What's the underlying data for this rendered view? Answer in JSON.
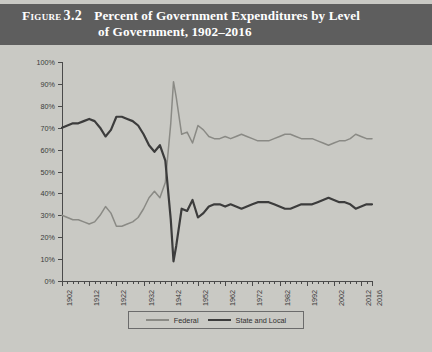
{
  "figure": {
    "label": "Figure",
    "number": "3.2",
    "title_line1": "Percent of Government Expenditures by Level",
    "title_line2": "of Government, 1902–2016",
    "banner_color": "#5e5e5e",
    "background_color": "#c9c9c4"
  },
  "legend": {
    "position": "bottom-center",
    "items": [
      {
        "label": "Federal",
        "color": "#8a8a85"
      },
      {
        "label": "State and Local",
        "color": "#3c3c3c"
      }
    ]
  },
  "chart_data": {
    "type": "line",
    "title": "Percent of Government Expenditures by Level of Government, 1902–2016",
    "xlabel": "",
    "ylabel": "",
    "ylim": [
      0,
      100
    ],
    "xlim": [
      1902,
      2016
    ],
    "grid": false,
    "y_tick_labels": [
      "0%",
      "10%",
      "20%",
      "30%",
      "40%",
      "50%",
      "60%",
      "70%",
      "80%",
      "90%",
      "100%"
    ],
    "y_ticks": [
      0,
      10,
      20,
      30,
      40,
      50,
      60,
      70,
      80,
      90,
      100
    ],
    "x_tick_labels": [
      "1902",
      "1912",
      "1922",
      "1932",
      "1942",
      "1952",
      "1962",
      "1972",
      "1982",
      "1992",
      "2002",
      "2012",
      "2016"
    ],
    "x_ticks": [
      1902,
      1912,
      1922,
      1932,
      1942,
      1952,
      1962,
      1972,
      1982,
      1992,
      2002,
      2012,
      2016
    ],
    "x_minor_tick_interval": 2,
    "x": [
      1902,
      1904,
      1906,
      1908,
      1910,
      1912,
      1914,
      1916,
      1918,
      1920,
      1922,
      1924,
      1926,
      1928,
      1930,
      1932,
      1934,
      1936,
      1938,
      1940,
      1942,
      1943,
      1944,
      1946,
      1948,
      1950,
      1952,
      1954,
      1956,
      1958,
      1960,
      1962,
      1964,
      1966,
      1968,
      1970,
      1972,
      1974,
      1976,
      1978,
      1980,
      1982,
      1984,
      1986,
      1988,
      1990,
      1992,
      1994,
      1996,
      1998,
      2000,
      2002,
      2004,
      2006,
      2008,
      2010,
      2012,
      2014,
      2016
    ],
    "series": [
      {
        "name": "Federal",
        "color": "#8a8a85",
        "values": [
          30,
          29,
          28,
          28,
          27,
          26,
          27,
          30,
          34,
          31,
          25,
          25,
          26,
          27,
          29,
          33,
          38,
          41,
          38,
          45,
          72,
          91,
          84,
          67,
          68,
          63,
          71,
          69,
          66,
          65,
          65,
          66,
          65,
          66,
          67,
          66,
          65,
          64,
          64,
          64,
          65,
          66,
          67,
          67,
          66,
          65,
          65,
          65,
          64,
          63,
          62,
          63,
          64,
          64,
          65,
          67,
          66,
          65,
          65
        ]
      },
      {
        "name": "State and Local",
        "color": "#3c3c3c",
        "values": [
          70,
          71,
          72,
          72,
          73,
          74,
          73,
          70,
          66,
          69,
          75,
          75,
          74,
          73,
          71,
          67,
          62,
          59,
          62,
          55,
          28,
          9,
          16,
          33,
          32,
          37,
          29,
          31,
          34,
          35,
          35,
          34,
          35,
          34,
          33,
          34,
          35,
          36,
          36,
          36,
          35,
          34,
          33,
          33,
          34,
          35,
          35,
          35,
          36,
          37,
          38,
          37,
          36,
          36,
          35,
          33,
          34,
          35,
          35
        ]
      }
    ]
  }
}
